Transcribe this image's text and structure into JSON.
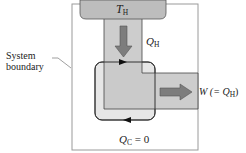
{
  "diagram": {
    "type": "heat-engine-energy-flow",
    "hot_reservoir": {
      "label": "T",
      "subscript": "H"
    },
    "heat_in": {
      "label": "Q",
      "subscript": "H"
    },
    "work_out": {
      "label": "W (= Q",
      "subscript": "H",
      "suffix": ")"
    },
    "heat_out": {
      "label": "Q",
      "subscript": "C",
      "suffix": " = 0"
    },
    "boundary_label": {
      "line1": "System",
      "line2": "boundary"
    },
    "colors": {
      "reservoir_fill": "#bdbdbd",
      "channel_fill": "#c4c4c4",
      "engine_fill": "#e0e0e0",
      "arrow_fill": "#7d7d7d",
      "stroke": "#333333",
      "frame": "#9a9a9a"
    }
  }
}
